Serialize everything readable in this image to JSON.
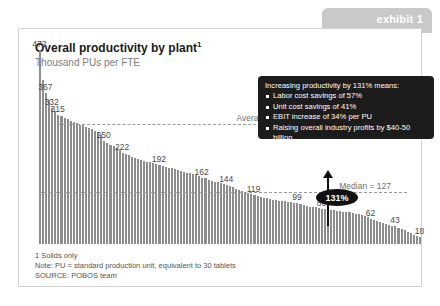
{
  "exhibit": {
    "label": "exhibit 1"
  },
  "chart": {
    "title": "Overall productivity by plant",
    "title_superscript": "1",
    "subtitle": "Thousand PUs per FTE"
  },
  "callout": {
    "heading": "Increasing productivity by 131% means:",
    "bullets": [
      "Labor cost savings of 57%",
      "Unit cost savings of  41%",
      "EBIT increase of 34% per PU",
      "Raising overall industry profits by $40-50 billion"
    ]
  },
  "annotations": {
    "top_quartile_label": "Average productivity of  top quartile = 293",
    "median_label": "Median = 127",
    "uplift_badge": "131%"
  },
  "footnotes": [
    "1  Solids only",
    "Note: PU = standard production unit, equivalent to 30 tablets",
    "SOURCE:  POBOS team"
  ],
  "colors": {
    "bar": "#8d8d8d",
    "callout_bg": "#1c1c1c",
    "tab_bg": "#c9c9c9",
    "dashline": "#9a9a9a",
    "card_border": "#d2d2d2"
  },
  "chart_data": {
    "type": "bar",
    "title": "Overall productivity by plant",
    "xlabel": "",
    "ylabel": "Thousand PUs per FTE",
    "ylim": [
      0,
      480
    ],
    "grid": false,
    "legend": null,
    "sorted": "descending",
    "reference_lines": [
      {
        "name": "Average productivity of top quartile",
        "value": 293,
        "style": "dashed"
      },
      {
        "name": "Median",
        "value": 127,
        "style": "dashed"
      }
    ],
    "labeled_points": [
      {
        "index": 0,
        "value": 472
      },
      {
        "index": 2,
        "value": 367
      },
      {
        "index": 4,
        "value": 332
      },
      {
        "index": 6,
        "value": 315
      },
      {
        "index": 21,
        "value": 250
      },
      {
        "index": 27,
        "value": 222
      },
      {
        "index": 39,
        "value": 192
      },
      {
        "index": 53,
        "value": 162
      },
      {
        "index": 61,
        "value": 144
      },
      {
        "index": 70,
        "value": 119
      },
      {
        "index": 84,
        "value": 99
      },
      {
        "index": 92,
        "value": 86
      },
      {
        "index": 108,
        "value": 62
      },
      {
        "index": 116,
        "value": 43
      },
      {
        "index": 124,
        "value": 18
      }
    ],
    "values": [
      472,
      400,
      367,
      352,
      332,
      324,
      315,
      312,
      308,
      304,
      300,
      297,
      294,
      291,
      289,
      286,
      283,
      280,
      276,
      272,
      266,
      250,
      246,
      242,
      238,
      234,
      229,
      222,
      219,
      216,
      213,
      210,
      208,
      205,
      203,
      201,
      199,
      197,
      195,
      192,
      190,
      188,
      186,
      184,
      182,
      180,
      178,
      176,
      174,
      172,
      170,
      168,
      165,
      162,
      160,
      157,
      154,
      152,
      150,
      148,
      146,
      144,
      141,
      138,
      135,
      132,
      129,
      126,
      124,
      121,
      119,
      117,
      115,
      113,
      111,
      110,
      108,
      107,
      106,
      105,
      104,
      103,
      102,
      101,
      99,
      97,
      95,
      93,
      91,
      90,
      89,
      88,
      86,
      85,
      84,
      83,
      82,
      81,
      80,
      79,
      78,
      77,
      76,
      74,
      72,
      70,
      68,
      65,
      62,
      59,
      56,
      54,
      51,
      49,
      47,
      45,
      43,
      40,
      37,
      33,
      29,
      26,
      23,
      20,
      18
    ]
  }
}
